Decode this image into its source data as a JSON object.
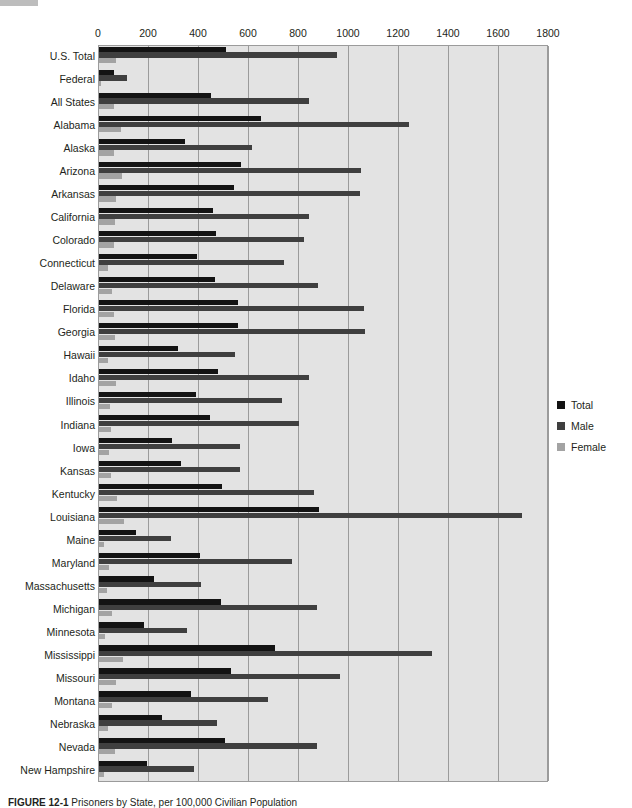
{
  "figure": {
    "caption_label": "FIGURE 12-1",
    "caption_text": "Prisoners by State, per 100,000 Civilian Population"
  },
  "legend": {
    "position": "right",
    "items": [
      {
        "name": "Total",
        "color": "#131313"
      },
      {
        "name": "Male",
        "color": "#3f3f3f"
      },
      {
        "name": "Female",
        "color": "#a3a3a3"
      }
    ]
  },
  "axis": {
    "ticks": [
      "0",
      "200",
      "400",
      "600",
      "800",
      "1000",
      "1200",
      "1400",
      "1600",
      "1800"
    ],
    "min": 0,
    "max": 1800,
    "step": 200
  },
  "chart_data": {
    "type": "bar",
    "orientation": "horizontal",
    "title": "Prisoners by State, per 100,000 Civilian Population",
    "xlabel": "",
    "ylabel": "",
    "xlim": [
      0,
      1800
    ],
    "grid": true,
    "legend_position": "right",
    "categories": [
      "U.S. Total",
      "Federal",
      "All States",
      "Alabama",
      "Alaska",
      "Arizona",
      "Arkansas",
      "California",
      "Colorado",
      "Connecticut",
      "Delaware",
      "Florida",
      "Georgia",
      "Hawaii",
      "Idaho",
      "Illinois",
      "Indiana",
      "Iowa",
      "Kansas",
      "Kentucky",
      "Louisiana",
      "Maine",
      "Maryland",
      "Massachusetts",
      "Michigan",
      "Minnesota",
      "Mississippi",
      "Missouri",
      "Montana",
      "Nebraska",
      "Nevada",
      "New Hampshire"
    ],
    "series": [
      {
        "name": "Total",
        "color": "#131313",
        "values": [
          506,
          60,
          446,
          648,
          342,
          567,
          541,
          454,
          467,
          392,
          463,
          555,
          554,
          314,
          474,
          388,
          442,
          291,
          327,
          492,
          881,
          148,
          403,
          218,
          487,
          180,
          702,
          529,
          368,
          252,
          502,
          192
        ]
      },
      {
        "name": "Male",
        "color": "#3f3f3f",
        "values": [
          952,
          112,
          840,
          1240,
          612,
          1048,
          1043,
          840,
          820,
          740,
          876,
          1060,
          1063,
          545,
          840,
          732,
          799,
          564,
          562,
          860,
          1690,
          288,
          772,
          406,
          872,
          352,
          1330,
          964,
          676,
          472,
          872,
          380
        ]
      },
      {
        "name": "Female",
        "color": "#a3a3a3",
        "values": [
          68,
          9,
          59,
          86,
          58,
          92,
          66,
          62,
          58,
          34,
          52,
          60,
          64,
          37,
          68,
          44,
          49,
          41,
          47,
          72,
          100,
          20,
          38,
          32,
          51,
          24,
          94,
          66,
          52,
          36,
          65,
          20
        ]
      }
    ]
  }
}
